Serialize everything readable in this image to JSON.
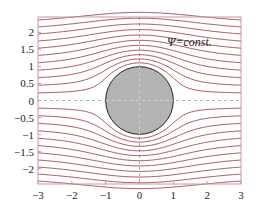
{
  "chart_data": {
    "type": "line",
    "title": "",
    "xlabel": "",
    "ylabel": "",
    "xlim": [
      -3,
      3
    ],
    "ylim": [
      -2.45,
      2.45
    ],
    "x_ticks": [
      "-3",
      "-2",
      "-1",
      "0",
      "1",
      "2",
      "3"
    ],
    "y_ticks": [
      "2",
      "1.5",
      "1",
      "0.5",
      "0",
      "-0.5",
      "-1",
      "-1.5",
      "-2"
    ],
    "annotation": "Ψ=const.",
    "cylinder": {
      "center": [
        0,
        0
      ],
      "radius": 1,
      "fill": "#b4b4b4"
    },
    "streamline_psi_values": [
      0.2,
      0.4,
      0.6,
      0.8,
      1.0,
      1.2,
      1.4,
      1.6,
      1.8,
      2.0,
      2.2,
      -0.2,
      -0.4,
      -0.6,
      -0.8,
      -1.0,
      -1.2,
      -1.4,
      -1.6,
      -1.8,
      -2.0,
      -2.2
    ],
    "colors": {
      "streamline": "#a0464b",
      "frame": "#c89a9c",
      "axis_dashed": "#999999"
    }
  }
}
